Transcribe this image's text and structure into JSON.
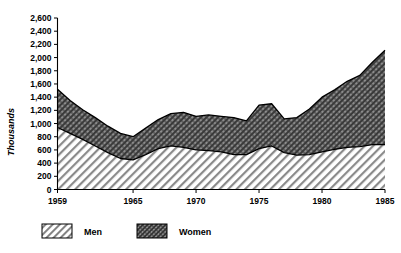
{
  "chart_data": {
    "type": "area",
    "stacked": true,
    "title": "",
    "xlabel": "",
    "ylabel": "Thousands",
    "ylim": [
      0,
      2600
    ],
    "xlim": [
      1959,
      1985
    ],
    "grid": false,
    "legend_position": "bottom-left",
    "y_ticks": [
      0,
      200,
      400,
      600,
      800,
      1000,
      1200,
      1400,
      1600,
      1800,
      2000,
      2200,
      2400,
      2600
    ],
    "y_tick_labels": [
      "0",
      "200",
      "400",
      "600",
      "800",
      "1,000",
      "1,200",
      "1,400",
      "1,600",
      "1,800",
      "2,000",
      "2,200",
      "2,400",
      "2,600"
    ],
    "x_ticks": [
      1959,
      1965,
      1970,
      1975,
      1980,
      1985
    ],
    "x_tick_labels": [
      "1959",
      "1965",
      "1970",
      "1975",
      "1980",
      "1985"
    ],
    "x": [
      1959,
      1960,
      1961,
      1962,
      1963,
      1964,
      1965,
      1966,
      1967,
      1968,
      1969,
      1970,
      1971,
      1972,
      1973,
      1974,
      1975,
      1976,
      1977,
      1978,
      1979,
      1980,
      1981,
      1982,
      1983,
      1984,
      1985
    ],
    "series": [
      {
        "name": "Men",
        "pattern": "diagonal-hatch-light",
        "values": [
          940,
          850,
          760,
          660,
          560,
          470,
          450,
          530,
          620,
          660,
          640,
          600,
          590,
          570,
          530,
          530,
          620,
          660,
          560,
          520,
          530,
          570,
          610,
          640,
          650,
          680,
          680
        ]
      },
      {
        "name": "Women",
        "pattern": "cross-hatch-dark",
        "values": [
          580,
          500,
          450,
          430,
          400,
          380,
          350,
          400,
          440,
          490,
          530,
          510,
          540,
          540,
          560,
          510,
          660,
          640,
          510,
          570,
          690,
          830,
          900,
          1000,
          1080,
          1250,
          1430
        ]
      }
    ],
    "totals": [
      1520,
      1350,
      1210,
      1090,
      960,
      850,
      800,
      930,
      1060,
      1150,
      1170,
      1110,
      1130,
      1110,
      1090,
      1040,
      1280,
      1300,
      1070,
      1090,
      1220,
      1400,
      1510,
      1640,
      1730,
      1930,
      2110
    ]
  },
  "legend": {
    "items": [
      {
        "label": "Men"
      },
      {
        "label": "Women"
      }
    ]
  },
  "colors": {
    "background": "#ffffff",
    "axis": "#000000",
    "men_fill": "#e8e8e8",
    "women_fill": "#6e6e6e"
  }
}
